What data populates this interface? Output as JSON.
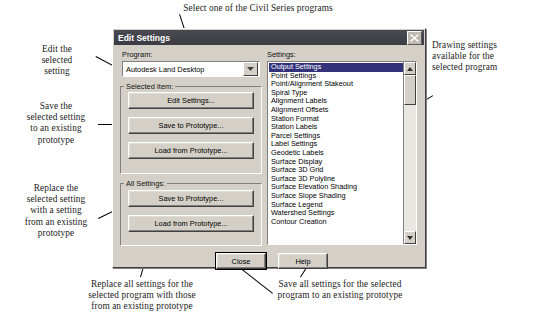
{
  "dialog": {
    "title": "Edit Settings",
    "close_icon": "close-icon",
    "program_label": "Program:",
    "program_value": "Autodesk Land Desktop",
    "selected_item_label": "Selected Item:",
    "all_settings_label": "All Settings:",
    "settings_label": "Settings:",
    "selected_item_buttons": [
      "Edit Settings...",
      "Save to Prototype...",
      "Load from Prototype..."
    ],
    "all_settings_buttons": [
      "Save to Prototype...",
      "Load from Prototype..."
    ],
    "footer_buttons": [
      "Close",
      "Help"
    ],
    "settings_list": [
      "Output Settings",
      "Point Settings",
      "Point/Alignment Stakeout",
      "Spiral Type",
      "Alignment Labels",
      "Alignment Offsets",
      "Station Format",
      "Station Labels",
      "Parcel Settings",
      "Label Settings",
      "Geodetic Labels",
      "Surface Display",
      "Surface 3D Grid",
      "Surface 3D Polyline",
      "Surface Elevation Shading",
      "Surface Slope Shading",
      "Surface Legend",
      "Watershed Settings",
      "Contour Creation"
    ],
    "selected_setting_index": 0
  },
  "annotations": {
    "top": "Select one of the Civil Series programs",
    "edit_selected": "Edit the\nselected\nsetting",
    "save_selected": "Save the\nselected setting\nto an existing\nprototype",
    "replace_selected": "Replace the\nselected setting\nwith a setting\nfrom an existing\nprototype",
    "drawing_settings": "Drawing settings\navailable for the\nselected program",
    "replace_all": "Replace all settings for the\nselected program with those\nfrom an existing prototype",
    "save_all": "Save all settings for the selected\nprogram to an existing prototype"
  },
  "colors": {
    "dialog_face": "#d4d0c8",
    "titlebar": "#3f3f48",
    "selection": "#32327a",
    "annotation_text": "#1b1b1b"
  }
}
